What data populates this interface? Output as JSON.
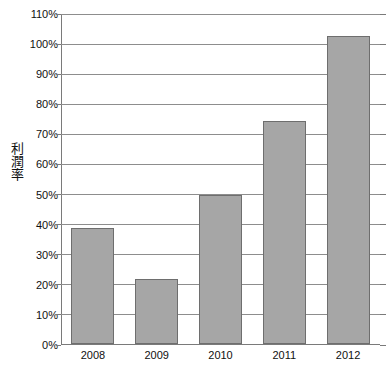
{
  "chart_data": {
    "type": "bar",
    "title": "",
    "subtitle": "",
    "xlabel": "",
    "ylabel": "利潤率",
    "categories": [
      "2008",
      "2009",
      "2010",
      "2011",
      "2012"
    ],
    "values": [
      38.5,
      21.5,
      49.5,
      74,
      102.5
    ],
    "value_unit": "%",
    "ylim": [
      0,
      110
    ],
    "ytick_step": 10,
    "ytick_labels": [
      "110%",
      "100%",
      "90%",
      "80%",
      "70%",
      "60%",
      "50%",
      "40%",
      "30%",
      "20%",
      "10%",
      "0%"
    ],
    "ytick_values": [
      110,
      100,
      90,
      80,
      70,
      60,
      50,
      40,
      30,
      20,
      10,
      0
    ],
    "grid": "horizontal",
    "legend": "none",
    "series": [
      {
        "name": "利潤率",
        "values": [
          38.5,
          21.5,
          49.5,
          74,
          102.5
        ]
      }
    ],
    "colors": {
      "bar_fill": "#a6a6a6",
      "bar_stroke": "#6e6e6e",
      "gridline": "#8d8d8d",
      "axis": "#7a7a7a",
      "text": "#101010",
      "background": "#ffffff"
    }
  }
}
